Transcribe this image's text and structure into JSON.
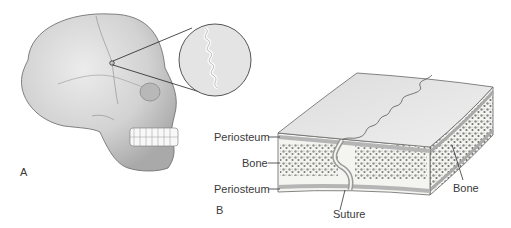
{
  "figure": {
    "panels": [
      {
        "id": "A",
        "label": "A",
        "subject": "Lateral view of human skull with magnified inset of cranial suture"
      },
      {
        "id": "B",
        "label": "B",
        "subject": "Cross-section block of cranial bone showing suture"
      }
    ],
    "labels": {
      "periosteum_top": "Periosteum",
      "bone_left": "Bone",
      "periosteum_bottom": "Periosteum",
      "suture": "Suture",
      "bone_right": "Bone"
    },
    "colors": {
      "bone_light": "#e6e6e6",
      "bone_mid": "#c8c8c8",
      "outline": "#555555",
      "spongy_dot": "#7a7a7a",
      "background": "#ffffff"
    }
  }
}
